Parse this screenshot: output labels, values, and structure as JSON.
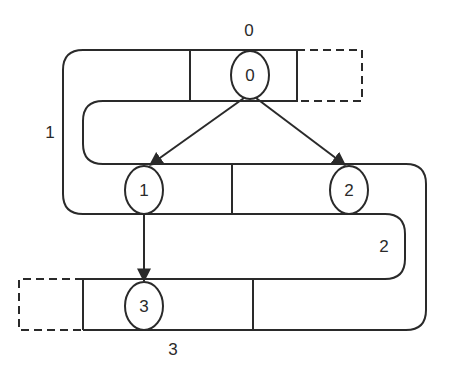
{
  "diagram": {
    "rows": [
      {
        "label": "0",
        "node": "0"
      },
      {
        "label": "1",
        "node": "1"
      },
      {
        "label": "2",
        "node": "2"
      },
      {
        "label": "3",
        "node": "3"
      }
    ],
    "nodes": [
      {
        "id": "n0",
        "label": "0"
      },
      {
        "id": "n1",
        "label": "1"
      },
      {
        "id": "n2",
        "label": "2"
      },
      {
        "id": "n3",
        "label": "3"
      }
    ],
    "edges": [
      {
        "from": "0",
        "to": "1"
      },
      {
        "from": "0",
        "to": "2"
      },
      {
        "from": "1",
        "to": "3"
      }
    ],
    "band_labels": {
      "top": "0",
      "left": "1",
      "right": "2",
      "bottom": "3"
    },
    "colors": {
      "stroke": "#2a2a2a",
      "background": "#ffffff"
    }
  }
}
